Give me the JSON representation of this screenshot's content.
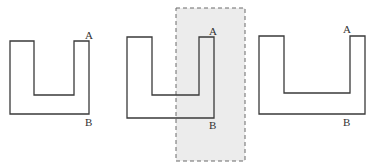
{
  "diagram": {
    "colors": {
      "stroke": "#3a3a3a",
      "band_fill": "#ececec",
      "band_border": "#6a6a6a"
    },
    "figures": [
      {
        "id": "figure-1",
        "label_a": "A",
        "label_b": "B",
        "points": "10,41 34,41 34,95 74,95 74,41 89,41 89,114 10,114",
        "a_pos": [
          85,
          39
        ],
        "b_pos": [
          85,
          126
        ]
      },
      {
        "id": "figure-2",
        "label_a": "A",
        "label_b": "B",
        "points": "127,37 152,37 152,95 199,95 199,37 214,37 214,118 127,118",
        "a_pos": [
          209,
          35
        ],
        "b_pos": [
          209,
          129
        ]
      },
      {
        "id": "figure-3",
        "label_a": "A",
        "label_b": "B",
        "points": "259,36 284,36 284,93 350,93 350,36 365,36 365,114 259,114",
        "a_pos": [
          343,
          33
        ],
        "b_pos": [
          343,
          126
        ]
      }
    ],
    "shaded_band": {
      "x": 176,
      "y": 8,
      "width": 69,
      "height": 153
    }
  }
}
